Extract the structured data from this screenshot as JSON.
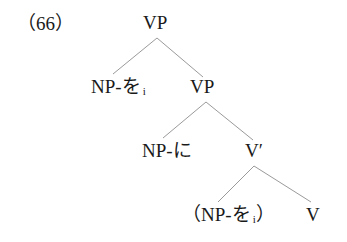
{
  "example_number": "（66）",
  "tree": {
    "root": {
      "label": "VP"
    },
    "nodes": [
      {
        "id": "vp-root",
        "label": "VP",
        "x": 157,
        "y": 13
      },
      {
        "id": "np-wo",
        "label": "NP-を",
        "subscript": "i",
        "x": 55,
        "y": 77
      },
      {
        "id": "vp-inner",
        "label": "VP",
        "x": 206,
        "y": 77
      },
      {
        "id": "np-ni",
        "label": "NP-に",
        "x": 147,
        "y": 141
      },
      {
        "id": "v-bar",
        "label": "V′",
        "x": 255,
        "y": 141
      },
      {
        "id": "np-wo-trace",
        "label": "（NP-を",
        "subscript": "i",
        "close": "）",
        "x": 185,
        "y": 205
      },
      {
        "id": "v",
        "label": "V",
        "x": 312,
        "y": 205
      }
    ],
    "edges": [
      {
        "from": "vp-root",
        "to": "np-wo"
      },
      {
        "from": "vp-root",
        "to": "vp-inner"
      },
      {
        "from": "vp-inner",
        "to": "np-ni"
      },
      {
        "from": "vp-inner",
        "to": "v-bar"
      },
      {
        "from": "v-bar",
        "to": "np-wo-trace"
      },
      {
        "from": "v-bar",
        "to": "v"
      }
    ]
  },
  "colors": {
    "text": "#1a1a1a",
    "edge": "#9a9a9a",
    "background": "#ffffff"
  }
}
